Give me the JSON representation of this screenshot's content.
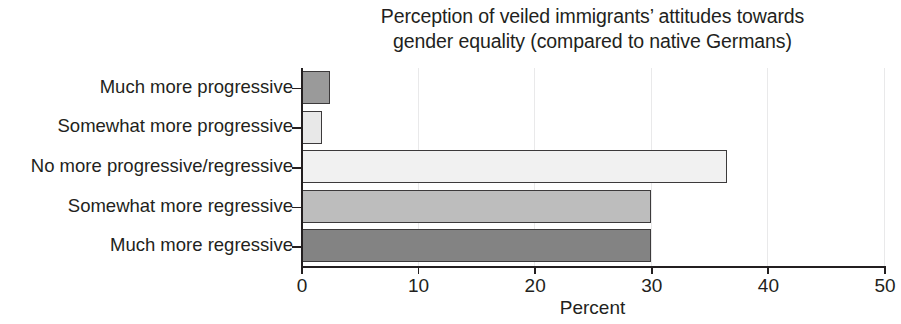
{
  "chart_data": {
    "type": "bar",
    "orientation": "horizontal",
    "title": "Perception of veiled immigrants’ attitudes towards gender equality (compared to native Germans)",
    "title_lines": [
      "Perception of veiled immigrants’ attitudes towards",
      "gender equality (compared to native Germans)"
    ],
    "categories": [
      "Much more progressive",
      "Somewhat more progressive",
      "No more progressive/regressive",
      "Somewhat more regressive",
      "Much more regressive"
    ],
    "values": [
      2.5,
      1.8,
      36.5,
      30.0,
      30.0
    ],
    "bar_colors": [
      "#9a9a9a",
      "#e8e8e8",
      "#f1f1f1",
      "#bdbdbd",
      "#838383"
    ],
    "bar_edge_color": "#3c3a3b",
    "xlabel": "Percent",
    "ylabel": "",
    "xlim": [
      0,
      50
    ],
    "xticks": [
      0,
      10,
      20,
      30,
      40,
      50
    ],
    "xticklabels": [
      "0",
      "10",
      "20",
      "30",
      "40",
      "50"
    ],
    "grid": "vertical-faint",
    "grid_color": "#e9e9ea",
    "legend": null,
    "axis_color": "#231f20",
    "background": "#ffffff"
  }
}
